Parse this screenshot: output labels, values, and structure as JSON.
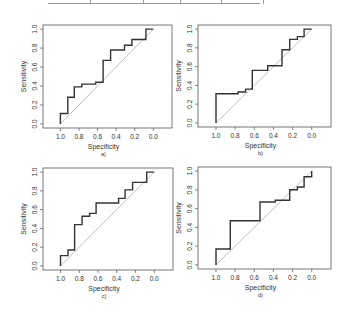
{
  "top_fragment": {
    "tick_x": [
      90,
      143,
      180,
      221,
      263
    ]
  },
  "chart_data": [
    {
      "type": "line",
      "panel_label": "a)",
      "xlabel": "Specificity",
      "ylabel": "Sensitivity",
      "xlim": [
        1.0,
        0.0
      ],
      "ylim": [
        0.0,
        1.0
      ],
      "x_ticks": [
        "1.0",
        "0.8",
        "0.6",
        "0.4",
        "0.2",
        "0.0"
      ],
      "y_ticks": [
        "0.0",
        "0.2",
        "0.4",
        "0.6",
        "0.8",
        "1.0"
      ],
      "reference_line": "diagonal",
      "specificity": [
        1.0,
        1.0,
        0.92,
        0.92,
        0.85,
        0.85,
        0.77,
        0.77,
        0.62,
        0.62,
        0.54,
        0.54,
        0.46,
        0.46,
        0.31,
        0.31,
        0.23,
        0.23,
        0.08,
        0.08,
        0.0
      ],
      "sensitivity": [
        0.0,
        0.11,
        0.11,
        0.28,
        0.28,
        0.39,
        0.39,
        0.42,
        0.42,
        0.44,
        0.44,
        0.67,
        0.67,
        0.78,
        0.78,
        0.83,
        0.83,
        0.89,
        0.89,
        1.0,
        1.0
      ]
    },
    {
      "type": "line",
      "panel_label": "b)",
      "xlabel": "Specificity",
      "ylabel": "Sensitivity",
      "xlim": [
        1.0,
        0.0
      ],
      "ylim": [
        0.0,
        1.0
      ],
      "x_ticks": [
        "1.0",
        "0.8",
        "0.6",
        "0.4",
        "0.2",
        "0.0"
      ],
      "y_ticks": [
        "0.0",
        "0.2",
        "0.4",
        "0.6",
        "0.8",
        "1.0"
      ],
      "reference_line": "diagonal",
      "specificity": [
        1.0,
        1.0,
        0.77,
        0.77,
        0.69,
        0.69,
        0.62,
        0.62,
        0.46,
        0.46,
        0.31,
        0.31,
        0.23,
        0.23,
        0.15,
        0.15,
        0.08,
        0.08,
        0.0
      ],
      "sensitivity": [
        0.0,
        0.31,
        0.31,
        0.33,
        0.33,
        0.36,
        0.36,
        0.56,
        0.56,
        0.61,
        0.61,
        0.78,
        0.78,
        0.89,
        0.89,
        0.92,
        0.92,
        1.0,
        1.0
      ]
    },
    {
      "type": "line",
      "panel_label": "c)",
      "xlabel": "Specificity",
      "ylabel": "Sensitivity",
      "xlim": [
        1.0,
        0.0
      ],
      "ylim": [
        0.0,
        1.0
      ],
      "x_ticks": [
        "1.0",
        "0.8",
        "0.6",
        "0.4",
        "0.2",
        "0.0"
      ],
      "y_ticks": [
        "0.0",
        "0.2",
        "0.4",
        "0.6",
        "0.8",
        "1.0"
      ],
      "reference_line": "diagonal",
      "specificity": [
        1.0,
        1.0,
        0.92,
        0.92,
        0.85,
        0.85,
        0.77,
        0.77,
        0.69,
        0.69,
        0.62,
        0.62,
        0.38,
        0.38,
        0.31,
        0.31,
        0.23,
        0.23,
        0.08,
        0.08,
        0.0
      ],
      "sensitivity": [
        0.0,
        0.11,
        0.11,
        0.17,
        0.17,
        0.44,
        0.44,
        0.53,
        0.53,
        0.56,
        0.56,
        0.67,
        0.67,
        0.72,
        0.72,
        0.81,
        0.81,
        0.89,
        0.89,
        1.0,
        1.0
      ]
    },
    {
      "type": "line",
      "panel_label": "d)",
      "xlabel": "Specificity",
      "ylabel": "Sensitivity",
      "xlim": [
        1.0,
        0.0
      ],
      "ylim": [
        0.0,
        1.0
      ],
      "x_ticks": [
        "1.0",
        "0.8",
        "0.6",
        "0.4",
        "0.2",
        "0.0"
      ],
      "y_ticks": [
        "0.0",
        "0.2",
        "0.4",
        "0.6",
        "0.8",
        "1.0"
      ],
      "reference_line": "diagonal",
      "specificity": [
        1.0,
        1.0,
        0.85,
        0.85,
        0.54,
        0.54,
        0.38,
        0.38,
        0.23,
        0.23,
        0.15,
        0.15,
        0.08,
        0.08,
        0.0,
        0.0
      ],
      "sensitivity": [
        0.0,
        0.17,
        0.17,
        0.47,
        0.47,
        0.67,
        0.67,
        0.69,
        0.69,
        0.8,
        0.8,
        0.83,
        0.83,
        0.94,
        0.94,
        1.0
      ]
    }
  ]
}
